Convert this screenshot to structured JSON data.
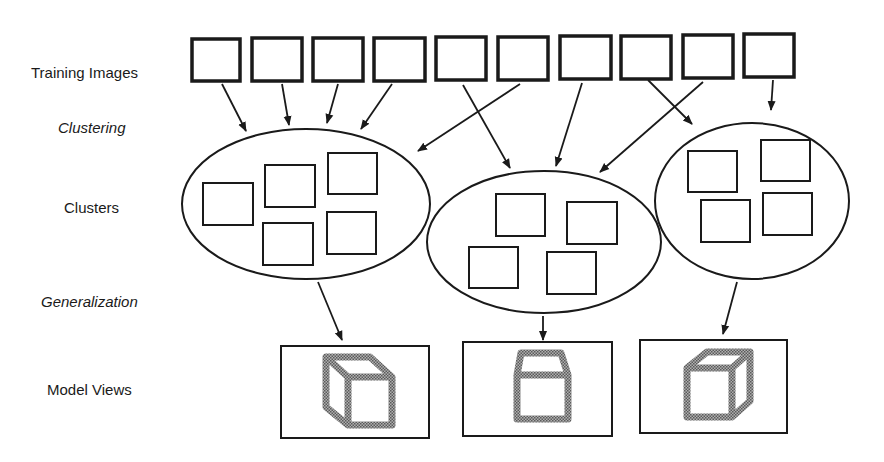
{
  "labels": {
    "training_images": "Training Images",
    "clustering": "Clustering",
    "clusters": "Clusters",
    "generalization": "Generalization",
    "model_views": "Model Views"
  },
  "diagram": {
    "training_image_count": 10,
    "clusters": [
      {
        "id": "cluster-1",
        "member_count": 5,
        "sources": [
          1,
          2,
          3,
          4,
          6
        ]
      },
      {
        "id": "cluster-2",
        "member_count": 4,
        "sources": [
          5,
          7,
          9
        ]
      },
      {
        "id": "cluster-3",
        "member_count": 4,
        "sources": [
          8,
          10
        ]
      }
    ],
    "model_views": [
      {
        "id": "model-view-1",
        "shape": "cube-left-oblique"
      },
      {
        "id": "model-view-2",
        "shape": "cube-front-top"
      },
      {
        "id": "model-view-3",
        "shape": "cube-right-oblique"
      }
    ],
    "colors": {
      "stroke": "#1a1a1a",
      "stipple": "#8a8a8a",
      "background": "#ffffff"
    }
  }
}
